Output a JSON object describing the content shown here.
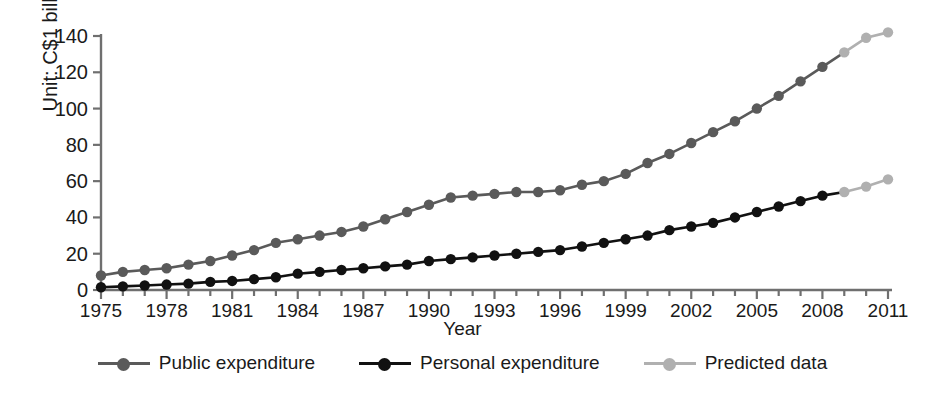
{
  "chart_data": {
    "type": "line",
    "title": "",
    "xlabel": "Year",
    "ylabel": "Unit: C$1 billion",
    "xlim": [
      1975,
      2011
    ],
    "ylim": [
      0,
      140
    ],
    "ytick_step": 20,
    "xtick_step": 3,
    "grid": false,
    "legend_position": "bottom",
    "x": [
      1975,
      1976,
      1977,
      1978,
      1979,
      1980,
      1981,
      1982,
      1983,
      1984,
      1985,
      1986,
      1987,
      1988,
      1989,
      1990,
      1991,
      1992,
      1993,
      1994,
      1995,
      1996,
      1997,
      1998,
      1999,
      2000,
      2001,
      2002,
      2003,
      2004,
      2005,
      2006,
      2007,
      2008,
      2009,
      2010,
      2011
    ],
    "ytick_labels": [
      "0",
      "20",
      "40",
      "60",
      "80",
      "100",
      "120",
      "140"
    ],
    "xtick_labels": [
      "1975",
      "1978",
      "1981",
      "1984",
      "1987",
      "1990",
      "1993",
      "1996",
      "1999",
      "2002",
      "2005",
      "2008",
      "2011"
    ],
    "series": [
      {
        "name": "Public expenditure",
        "color": "#5a5a5a",
        "values": [
          8,
          10,
          11,
          12,
          14,
          16,
          19,
          22,
          26,
          28,
          30,
          32,
          35,
          39,
          43,
          47,
          51,
          52,
          53,
          54,
          54,
          55,
          58,
          60,
          64,
          70,
          75,
          81,
          87,
          93,
          100,
          107,
          115,
          123,
          131,
          139,
          142
        ],
        "predicted_from_index": 34
      },
      {
        "name": "Personal expenditure",
        "color": "#111111",
        "values": [
          1.5,
          2,
          2.5,
          3,
          3.5,
          4.5,
          5,
          6,
          7,
          9,
          10,
          11,
          12,
          13,
          14,
          16,
          17,
          18,
          19,
          20,
          21,
          22,
          24,
          26,
          28,
          30,
          33,
          35,
          37,
          40,
          43,
          46,
          49,
          52,
          54,
          57,
          61
        ],
        "predicted_from_index": 34
      }
    ],
    "predicted_color": "#b0b0b0",
    "legend": [
      {
        "label": "Public expenditure",
        "color": "#5a5a5a"
      },
      {
        "label": "Personal expenditure",
        "color": "#111111"
      },
      {
        "label": "Predicted data",
        "color": "#b0b0b0"
      }
    ]
  }
}
